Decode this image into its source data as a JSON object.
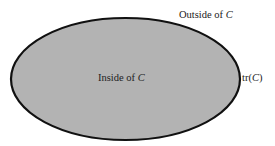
{
  "diagram": {
    "labels": {
      "outside_text": "Outside of ",
      "outside_var": "C",
      "inside_text": "Inside of ",
      "inside_var": "C",
      "trace_prefix": "tr(",
      "trace_var": "C",
      "trace_suffix": ")"
    },
    "colors": {
      "region_fill": "#b3b3b3",
      "curve_stroke": "#111111",
      "background": "#ffffff"
    }
  }
}
